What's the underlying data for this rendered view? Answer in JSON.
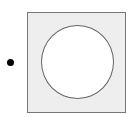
{
  "diagram": {
    "bullet": {
      "shape": "dot",
      "color": "#000000"
    },
    "square": {
      "fill": "#eeeeee",
      "stroke": "#777777"
    },
    "circle": {
      "fill": "#ffffff",
      "stroke": "#666666"
    }
  }
}
